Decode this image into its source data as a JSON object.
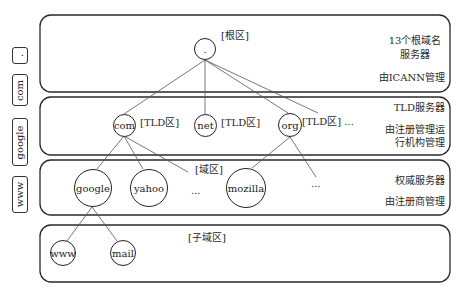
{
  "side_labels": [
    ".",
    "com",
    "google",
    "www"
  ],
  "layers": [
    {
      "zone_label": "[根区]",
      "description_lines": [
        "13个根域名",
        "服务器"
      ],
      "manager": "由ICANN管理",
      "nodes": [
        "."
      ]
    },
    {
      "zone_labels": [
        "[TLD区]",
        "[TLD区]",
        "[TLD区] ..."
      ],
      "description": "TLD服务器",
      "manager_lines": [
        "由注册管理运",
        "行机构管理"
      ],
      "nodes": [
        "com",
        "net",
        "org"
      ]
    },
    {
      "zone_label": "[域区]",
      "description": "权威服务器",
      "manager": "由注册商管理",
      "nodes": [
        "google",
        "yahoo",
        "mozilla"
      ],
      "ellipses": [
        "...",
        "..."
      ]
    },
    {
      "zone_label": "[子域区]",
      "nodes": [
        "www",
        "mail"
      ]
    }
  ],
  "colors": {
    "stroke": "#222222",
    "edge": "#555555",
    "background": "#ffffff"
  }
}
